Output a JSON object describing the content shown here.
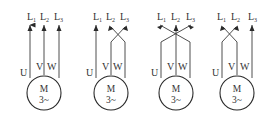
{
  "diagram": {
    "motor_label": "M",
    "motor_phase_label": "3~",
    "terminals": [
      "U",
      "V",
      "W"
    ],
    "lines": [
      {
        "main": "L",
        "sub": "1"
      },
      {
        "main": "L",
        "sub": "2"
      },
      {
        "main": "L",
        "sub": "3"
      }
    ],
    "variants": [
      {
        "id": "a",
        "mapping": "U-L1, V-L2, W-L3 (straight)"
      },
      {
        "id": "b",
        "mapping": "U-L1, V-L3, W-L2 (V and W crossed)"
      },
      {
        "id": "c",
        "mapping": "U-L3, V-L2, W-L1 (U and W crossed through center)"
      },
      {
        "id": "d",
        "mapping": "U-L2, V-L1, W-L3 (U and V crossed)"
      }
    ],
    "colors": {
      "line": "#3a3a3a",
      "text": "#333333",
      "background": "#ffffff"
    }
  }
}
